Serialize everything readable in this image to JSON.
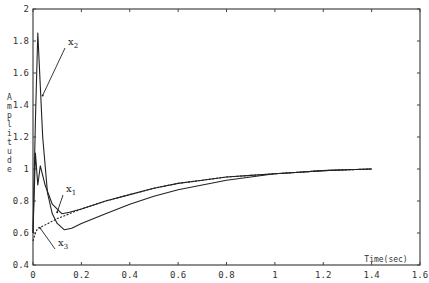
{
  "chart_data": {
    "type": "line",
    "title": "",
    "xlabel": "Time(sec)",
    "ylabel": "Amplitude",
    "xlim": [
      0,
      1.6
    ],
    "ylim": [
      0.4,
      2.0
    ],
    "xticks": [
      0,
      0.2,
      0.4,
      0.6,
      0.8,
      1,
      1.2,
      1.4,
      1.6
    ],
    "xtick_labels": [
      "0",
      "0.2",
      "0.4",
      "0.6",
      "0.8",
      "1",
      "1.2",
      "1.4",
      "1.6"
    ],
    "yticks": [
      0.4,
      0.6,
      0.8,
      1.0,
      1.2,
      1.4,
      1.6,
      1.8,
      2.0
    ],
    "ytick_labels": [
      "0.4",
      "0.6",
      "0.8",
      "1",
      "1.2",
      "1.4",
      "1.6",
      "1.8",
      "2"
    ],
    "grid": false,
    "legend": "none (inline annotations)",
    "series": [
      {
        "name": "x1",
        "style": "solid",
        "x": [
          0,
          0.01,
          0.02,
          0.03,
          0.05,
          0.08,
          0.12,
          0.15,
          0.2,
          0.3,
          0.4,
          0.5,
          0.6,
          0.7,
          0.8,
          0.9,
          1.0,
          1.1,
          1.2,
          1.3,
          1.4
        ],
        "y": [
          0.6,
          1.1,
          0.9,
          1.02,
          0.9,
          0.78,
          0.72,
          0.73,
          0.75,
          0.8,
          0.84,
          0.88,
          0.91,
          0.93,
          0.95,
          0.96,
          0.97,
          0.98,
          0.99,
          0.995,
          1.0
        ]
      },
      {
        "name": "x2",
        "style": "solid",
        "x": [
          0,
          0.01,
          0.02,
          0.04,
          0.06,
          0.08,
          0.1,
          0.13,
          0.16,
          0.2,
          0.3,
          0.4,
          0.5,
          0.6,
          0.7,
          0.8,
          0.9,
          1.0,
          1.1,
          1.2,
          1.3,
          1.4
        ],
        "y": [
          0.6,
          1.3,
          1.85,
          1.2,
          0.85,
          0.72,
          0.66,
          0.62,
          0.63,
          0.66,
          0.72,
          0.78,
          0.83,
          0.87,
          0.9,
          0.93,
          0.95,
          0.97,
          0.98,
          0.99,
          0.995,
          1.0
        ]
      },
      {
        "name": "x3",
        "style": "dashed",
        "x": [
          0,
          0.01,
          0.02,
          0.05,
          0.1,
          0.15,
          0.2,
          0.3,
          0.4,
          0.5,
          0.6,
          0.7,
          0.8,
          0.9,
          1.0,
          1.1,
          1.2,
          1.3,
          1.4
        ],
        "y": [
          0.55,
          0.6,
          0.63,
          0.65,
          0.69,
          0.72,
          0.75,
          0.8,
          0.84,
          0.88,
          0.91,
          0.93,
          0.95,
          0.96,
          0.97,
          0.98,
          0.99,
          0.995,
          1.0
        ]
      }
    ],
    "annotations": [
      {
        "text": "x",
        "sub": "2",
        "pointer_to": [
          0.04,
          1.46
        ]
      },
      {
        "text": "x",
        "sub": "1",
        "pointer_to": [
          0.1,
          0.73
        ]
      },
      {
        "text": "x",
        "sub": "3",
        "pointer_to": [
          0.03,
          0.63
        ]
      }
    ]
  }
}
